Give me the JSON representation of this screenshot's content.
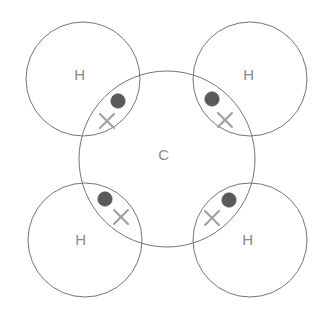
{
  "figure": {
    "molecule": "CH4",
    "width": 333,
    "height": 319,
    "background_color": "#ffffff",
    "stroke_color": "#757575",
    "label_color": "#8a8a8a",
    "dot_color": "#5a5a5a",
    "cross_color": "#a0a0a0"
  },
  "chart_data": {
    "type": "diagram",
    "diagram_kind": "dot-and-cross bonding diagram",
    "central_atom": {
      "label": "C",
      "cx": 167,
      "cy": 159,
      "r": 88,
      "label_x": 164,
      "label_y": 156
    },
    "outer_atoms": [
      {
        "id": "h-top-left",
        "label": "H",
        "cx": 83,
        "cy": 79,
        "r": 57,
        "label_x": 80,
        "label_y": 76
      },
      {
        "id": "h-top-right",
        "label": "H",
        "cx": 250,
        "cy": 79,
        "r": 57,
        "label_x": 249,
        "label_y": 76
      },
      {
        "id": "h-bottom-left",
        "label": "H",
        "cx": 85,
        "cy": 240,
        "r": 57,
        "label_x": 81,
        "label_y": 241
      },
      {
        "id": "h-bottom-right",
        "label": "H",
        "cx": 250,
        "cy": 240,
        "r": 57,
        "label_x": 248,
        "label_y": 241
      }
    ],
    "bonding_pairs": [
      {
        "id": "bond-top-left",
        "bond_between": [
          "C",
          "H"
        ],
        "dot": {
          "cx": 118,
          "cy": 101,
          "r": 7.2,
          "represents": "carbon electron"
        },
        "cross": {
          "cx": 107,
          "cy": 121,
          "size": 7.0,
          "represents": "hydrogen electron"
        }
      },
      {
        "id": "bond-top-right",
        "bond_between": [
          "C",
          "H"
        ],
        "dot": {
          "cx": 212,
          "cy": 99,
          "r": 7.2,
          "represents": "carbon electron"
        },
        "cross": {
          "cx": 225,
          "cy": 120,
          "size": 7.0,
          "represents": "hydrogen electron"
        }
      },
      {
        "id": "bond-bottom-left",
        "bond_between": [
          "C",
          "H"
        ],
        "dot": {
          "cx": 105,
          "cy": 199,
          "r": 7.2,
          "represents": "carbon electron"
        },
        "cross": {
          "cx": 121,
          "cy": 217,
          "size": 7.0,
          "represents": "hydrogen electron"
        }
      },
      {
        "id": "bond-bottom-right",
        "bond_between": [
          "C",
          "H"
        ],
        "dot": {
          "cx": 229,
          "cy": 200,
          "r": 7.2,
          "represents": "carbon electron"
        },
        "cross": {
          "cx": 212,
          "cy": 218,
          "size": 7.0,
          "represents": "hydrogen electron"
        }
      }
    ],
    "legend": [],
    "annotations": [],
    "counts": {
      "hydrogen_atoms": 4,
      "carbon_atoms": 1,
      "bonding_pairs": 4,
      "dots_per_bond": 1,
      "crosses_per_bond": 1
    }
  }
}
